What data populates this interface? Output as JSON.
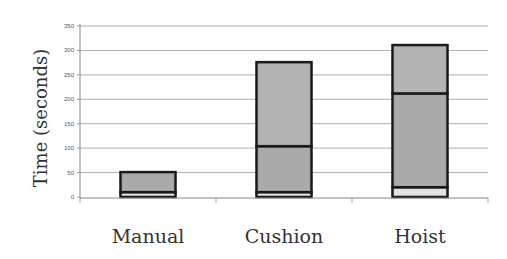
{
  "chart_data": {
    "type": "bar",
    "stacked": true,
    "title": "",
    "xlabel": "",
    "ylabel": "Time (seconds)",
    "ylim": [
      0,
      350
    ],
    "yticks": [
      0,
      50,
      100,
      150,
      200,
      250,
      300,
      350
    ],
    "grid": true,
    "legend": null,
    "categories": [
      "Manual",
      "Cushion",
      "Hoist"
    ],
    "series": [
      {
        "name": "Segment 1 (bottom)",
        "color": "#e2e2e2",
        "values": [
          10,
          10,
          20
        ]
      },
      {
        "name": "Segment 2 (middle)",
        "color": "#a9a9a9",
        "values": [
          41,
          94,
          192
        ]
      },
      {
        "name": "Segment 3 (top)",
        "color": "#b3b3b3",
        "values": [
          0,
          172,
          99
        ]
      }
    ],
    "totals": [
      51,
      276,
      311
    ]
  }
}
